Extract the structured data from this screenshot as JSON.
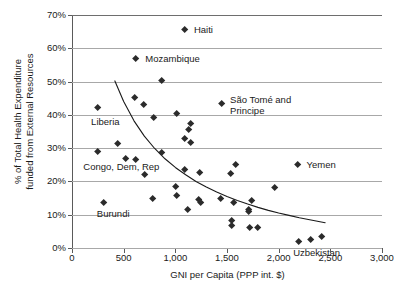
{
  "chart_data": {
    "type": "scatter",
    "title": "",
    "xlabel": "GNI per Capita (PPP int. $)",
    "ylabel": "% of Total Health Expenditure\nfunded from External Resources",
    "xlim": [
      0,
      3000
    ],
    "ylim": [
      0,
      70
    ],
    "xticks": [
      0,
      500,
      1000,
      1500,
      2000,
      2500,
      3000
    ],
    "xtick_labels": [
      "0",
      "500",
      "1,000",
      "1,500",
      "2,000",
      "2,500",
      "3,000"
    ],
    "yticks": [
      0,
      10,
      20,
      30,
      40,
      50,
      60,
      70
    ],
    "ytick_labels": [
      "0%",
      "10%",
      "20%",
      "30%",
      "40%",
      "50%",
      "60%",
      "70%"
    ],
    "grid": "horizontal",
    "legend": "none",
    "marker_style": "diamond",
    "marker_color": "#2b2b2b",
    "grid_color": "#a8a8a8",
    "axis_color": "#5a5a5a",
    "points": [
      {
        "x": 1090,
        "y": 65.5
      },
      {
        "x": 620,
        "y": 56.8
      },
      {
        "x": 870,
        "y": 50.3
      },
      {
        "x": 610,
        "y": 45.2
      },
      {
        "x": 690,
        "y": 43.1
      },
      {
        "x": 1450,
        "y": 43.4
      },
      {
        "x": 250,
        "y": 42.3
      },
      {
        "x": 1010,
        "y": 40.3
      },
      {
        "x": 790,
        "y": 39.1
      },
      {
        "x": 1150,
        "y": 37.2
      },
      {
        "x": 1130,
        "y": 35.5
      },
      {
        "x": 1090,
        "y": 32.9
      },
      {
        "x": 1150,
        "y": 31.6
      },
      {
        "x": 440,
        "y": 31.2
      },
      {
        "x": 250,
        "y": 28.9
      },
      {
        "x": 870,
        "y": 28.6
      },
      {
        "x": 520,
        "y": 26.9
      },
      {
        "x": 620,
        "y": 26.6
      },
      {
        "x": 1580,
        "y": 25.1
      },
      {
        "x": 2180,
        "y": 24.9
      },
      {
        "x": 1090,
        "y": 23.6
      },
      {
        "x": 1240,
        "y": 22.5
      },
      {
        "x": 1540,
        "y": 22.4
      },
      {
        "x": 700,
        "y": 22.1
      },
      {
        "x": 1000,
        "y": 18.5
      },
      {
        "x": 1960,
        "y": 18.1
      },
      {
        "x": 1010,
        "y": 15.6
      },
      {
        "x": 780,
        "y": 14.9
      },
      {
        "x": 1440,
        "y": 14.8
      },
      {
        "x": 1230,
        "y": 14.6
      },
      {
        "x": 1740,
        "y": 14.1
      },
      {
        "x": 1250,
        "y": 13.7
      },
      {
        "x": 1560,
        "y": 13.6
      },
      {
        "x": 310,
        "y": 13.6
      },
      {
        "x": 1120,
        "y": 11.6
      },
      {
        "x": 1710,
        "y": 11.4
      },
      {
        "x": 1710,
        "y": 10.9
      },
      {
        "x": 1545,
        "y": 8.3
      },
      {
        "x": 1545,
        "y": 6.6
      },
      {
        "x": 1720,
        "y": 6.1
      },
      {
        "x": 1800,
        "y": 6.2
      },
      {
        "x": 2190,
        "y": 1.9
      },
      {
        "x": 2310,
        "y": 2.5
      },
      {
        "x": 2420,
        "y": 3.5
      }
    ],
    "annotations": [
      {
        "label": "Haiti",
        "x": 1090,
        "y": 65.5,
        "text_x": 1180,
        "text_y": 65.5
      },
      {
        "label": "Mozambique",
        "x": 620,
        "y": 56.8,
        "text_x": 710,
        "text_y": 56.8
      },
      {
        "label": "São Tomé and\n  Principe",
        "x": 1450,
        "y": 43.4,
        "text_x": 1530,
        "text_y": 44.4
      },
      {
        "label": "Liberia",
        "x": 250,
        "y": 42.3,
        "text_x": 185,
        "text_y": 38.0
      },
      {
        "label": "Congo, Dem, Rep",
        "x": 250,
        "y": 28.9,
        "text_x": 110,
        "text_y": 24.4
      },
      {
        "label": "Yemen",
        "x": 2180,
        "y": 24.9,
        "text_x": 2270,
        "text_y": 24.9
      },
      {
        "label": "Burundi",
        "x": 310,
        "y": 13.6,
        "text_x": 240,
        "text_y": 10.3
      },
      {
        "label": "Uzbekistan",
        "x": 2310,
        "y": 2.5,
        "text_x": 2140,
        "text_y": -1.6
      }
    ],
    "trend_line": {
      "description": "fitted decreasing power/exponential curve",
      "color": "#1a1a1a",
      "points": [
        {
          "x": 415,
          "y": 50.2
        },
        {
          "x": 500,
          "y": 44.0
        },
        {
          "x": 600,
          "y": 38.2
        },
        {
          "x": 700,
          "y": 33.6
        },
        {
          "x": 800,
          "y": 29.9
        },
        {
          "x": 900,
          "y": 26.8
        },
        {
          "x": 1000,
          "y": 24.2
        },
        {
          "x": 1100,
          "y": 22.0
        },
        {
          "x": 1200,
          "y": 20.0
        },
        {
          "x": 1300,
          "y": 18.3
        },
        {
          "x": 1400,
          "y": 16.8
        },
        {
          "x": 1500,
          "y": 15.5
        },
        {
          "x": 1600,
          "y": 14.3
        },
        {
          "x": 1700,
          "y": 13.2
        },
        {
          "x": 1800,
          "y": 12.2
        },
        {
          "x": 1900,
          "y": 11.3
        },
        {
          "x": 2000,
          "y": 10.5
        },
        {
          "x": 2100,
          "y": 9.8
        },
        {
          "x": 2200,
          "y": 9.1
        },
        {
          "x": 2300,
          "y": 8.5
        },
        {
          "x": 2400,
          "y": 7.9
        },
        {
          "x": 2450,
          "y": 7.6
        }
      ]
    }
  }
}
